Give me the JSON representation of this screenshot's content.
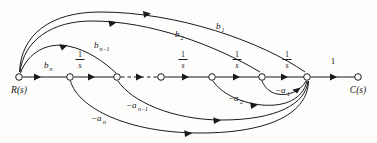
{
  "diagram": {
    "type": "signal-flow-graph",
    "background_color": "#fdfdfb",
    "line_color": "#1a191d",
    "input_node_label": "R(s)",
    "output_node_label": "C(s)",
    "forward_gain_labels": {
      "b_n": "b",
      "b_n_sub": "n",
      "b_nm1": "b",
      "b_nm1_sub": "n−1",
      "b_2": "b",
      "b_2_sub": "2",
      "b_1": "b",
      "b_1_sub": "1"
    },
    "integrator_label": {
      "numerator": "1",
      "denominator": "s"
    },
    "integrator_count": 5,
    "output_gain_label": "1",
    "feedback_gain_labels": {
      "a_1": "−a",
      "a_1_sub": "1",
      "a_2": "−a",
      "a_2_sub": "2",
      "a_nm1": "−a",
      "a_nm1_sub": "n−1",
      "a_n": "−a",
      "a_n_sub": "n"
    },
    "nodes": [
      {
        "id": "n0",
        "label": "R(s)",
        "x": 19,
        "y": 77
      },
      {
        "id": "n1",
        "label": "",
        "x": 70,
        "y": 77
      },
      {
        "id": "n2",
        "label": "",
        "x": 117,
        "y": 77
      },
      {
        "id": "n3",
        "label": "",
        "x": 161,
        "y": 77
      },
      {
        "id": "n4",
        "label": "",
        "x": 212,
        "y": 77
      },
      {
        "id": "n5",
        "label": "",
        "x": 262,
        "y": 77
      },
      {
        "id": "n6",
        "label": "",
        "x": 307,
        "y": 77
      },
      {
        "id": "n7",
        "label": "C(s)",
        "x": 358,
        "y": 77
      }
    ],
    "forward_edges": [
      {
        "from": "n0",
        "to": "n1",
        "gain": "b_n",
        "style": "solid"
      },
      {
        "from": "n1",
        "to": "n2",
        "gain": "1/s",
        "style": "solid"
      },
      {
        "from": "n2",
        "to": "n3",
        "gain": "",
        "style": "dashed"
      },
      {
        "from": "n3",
        "to": "n4",
        "gain": "1/s",
        "style": "solid"
      },
      {
        "from": "n4",
        "to": "n5",
        "gain": "1/s",
        "style": "solid"
      },
      {
        "from": "n5",
        "to": "n6",
        "gain": "1/s",
        "style": "solid"
      },
      {
        "from": "n6",
        "to": "n7",
        "gain": "1",
        "style": "solid"
      }
    ],
    "feedforward_arcs": [
      {
        "from": "n0",
        "to": "n2",
        "gain": "b_{n-1}"
      },
      {
        "from": "n0",
        "to": "n5",
        "gain": "b_2"
      },
      {
        "from": "n0",
        "to": "n6",
        "gain": "b_1"
      }
    ],
    "feedback_arcs": [
      {
        "from": "n6",
        "to": "n5",
        "gain": "-a_1"
      },
      {
        "from": "n6",
        "to": "n4",
        "gain": "-a_2"
      },
      {
        "from": "n6",
        "to": "n2",
        "gain": "-a_{n-1}"
      },
      {
        "from": "n6",
        "to": "n1",
        "gain": "-a_n"
      }
    ]
  }
}
